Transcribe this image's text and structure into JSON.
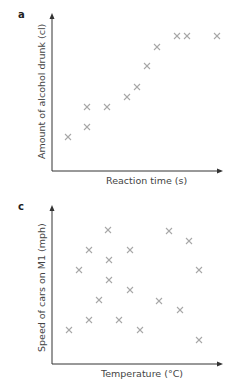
{
  "chart_data": [
    {
      "type": "scatter",
      "panel_label": "a",
      "title": "",
      "xlabel": "Reaction time (s)",
      "ylabel": "Amount of alcohol drunk (cl)",
      "ticks": "none",
      "marker": "x",
      "marker_color": "#a8a8a8",
      "axis_color": "#333333",
      "points_px": [
        [
          68,
          137
        ],
        [
          87,
          127
        ],
        [
          87,
          107
        ],
        [
          107,
          107
        ],
        [
          127,
          97
        ],
        [
          137,
          87
        ],
        [
          147,
          66
        ],
        [
          157,
          47
        ],
        [
          177,
          36
        ],
        [
          187,
          36
        ],
        [
          217,
          36
        ]
      ]
    },
    {
      "type": "scatter",
      "panel_label": "c",
      "title": "",
      "xlabel": "Temperature (°C)",
      "ylabel": "Speed of cars on M1 (mph)",
      "ticks": "none",
      "marker": "x",
      "marker_color": "#a8a8a8",
      "axis_color": "#333333",
      "points_px": [
        [
          108,
          38
        ],
        [
          169,
          39
        ],
        [
          189,
          49
        ],
        [
          89,
          58
        ],
        [
          130,
          58
        ],
        [
          109,
          68
        ],
        [
          79,
          78
        ],
        [
          199,
          78
        ],
        [
          109,
          88
        ],
        [
          130,
          98
        ],
        [
          99,
          108
        ],
        [
          159,
          109
        ],
        [
          180,
          118
        ],
        [
          89,
          128
        ],
        [
          119,
          128
        ],
        [
          69,
          138
        ],
        [
          140,
          138
        ],
        [
          199,
          148
        ]
      ]
    }
  ]
}
